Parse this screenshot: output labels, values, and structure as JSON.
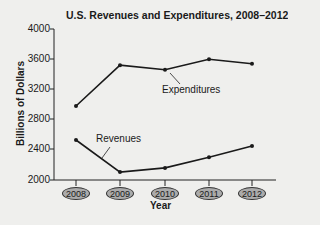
{
  "chart_data": {
    "type": "line",
    "title": "U.S. Revenues and Expenditures, 2008–2012",
    "xlabel": "Year",
    "ylabel": "Billions of Dollars",
    "categories": [
      "2008",
      "2009",
      "2010",
      "2011",
      "2012"
    ],
    "series": [
      {
        "name": "Expenditures",
        "values": [
          2980,
          3520,
          3460,
          3600,
          3540
        ]
      },
      {
        "name": "Revenues",
        "values": [
          2530,
          2105,
          2160,
          2300,
          2450
        ]
      }
    ],
    "ylim": [
      2000,
      4000
    ],
    "yticks": [
      "4000",
      "3600",
      "3200",
      "2800",
      "2400",
      "2000"
    ],
    "grid": false,
    "legend": "inline annotations"
  },
  "annotations": {
    "expenditures": "Expenditures",
    "revenues": "Revenues"
  }
}
